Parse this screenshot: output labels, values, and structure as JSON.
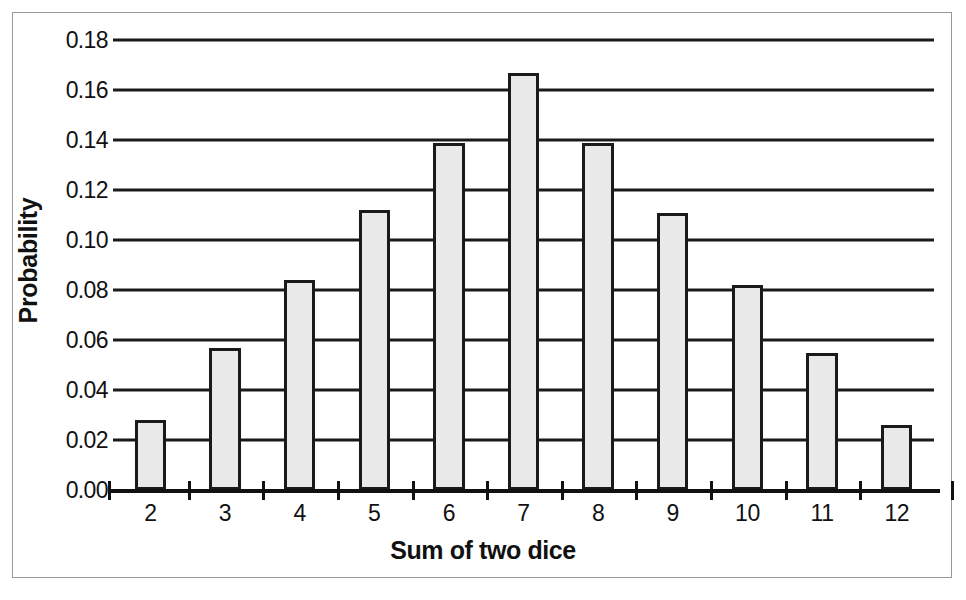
{
  "chart_data": {
    "type": "bar",
    "title": "",
    "xlabel": "Sum of two dice",
    "ylabel": "Probability",
    "categories": [
      "2",
      "3",
      "4",
      "5",
      "6",
      "7",
      "8",
      "9",
      "10",
      "11",
      "12"
    ],
    "values": [
      0.028,
      0.057,
      0.084,
      0.112,
      0.139,
      0.167,
      0.139,
      0.111,
      0.082,
      0.055,
      0.026
    ],
    "ylim": [
      0.0,
      0.18
    ],
    "ytick_labels": [
      "0.00",
      "0.02",
      "0.04",
      "0.06",
      "0.08",
      "0.10",
      "0.12",
      "0.14",
      "0.16",
      "0.18"
    ],
    "ytick_values": [
      0.0,
      0.02,
      0.04,
      0.06,
      0.08,
      0.1,
      0.12,
      0.14,
      0.16,
      0.18
    ],
    "grid": true,
    "legend": "none",
    "bar_fill_color": "#e9e9e9",
    "bar_edge_color": "#1a1a1a",
    "axis_color": "#111111",
    "frame_color": "#9a9a9a",
    "background_color": "#ffffff"
  }
}
